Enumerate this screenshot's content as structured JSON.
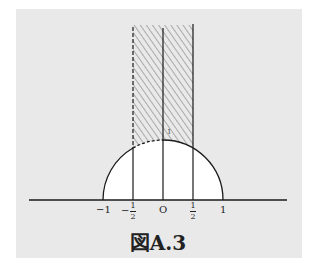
{
  "figure": {
    "caption": "図A.3",
    "background_color": "#e9e9e9",
    "line_color": "#1a1a1a",
    "region_fill": "#ffffff",
    "hatch_color": "#555555"
  },
  "axis": {
    "tick_labels": {
      "neg_one": "−1",
      "neg_half_sign": "−",
      "half_num": "1",
      "half_den": "2",
      "origin": "O",
      "pos_one": "1"
    },
    "point_label_top": "1"
  },
  "diagram": {
    "semicircle_radius": 1,
    "vertical_lines": [
      -0.5,
      0,
      0.5
    ],
    "hatched_region": "|x| <= 1/2, |z| >= 1, y > 0",
    "dashed_boundaries": [
      "x = -1/2",
      "arc from -1/2 to 0"
    ]
  }
}
